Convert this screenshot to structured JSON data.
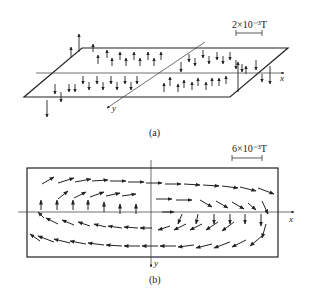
{
  "figure": {
    "panel_a": {
      "caption": "(a)",
      "scale_label": "2×10⁻³T",
      "x_label": "x",
      "y_label": "y",
      "description": "Vertical field component arrows over a tilted plane; upward arrows on upper-left and lower-right quadrants, downward on the others"
    },
    "panel_b": {
      "caption": "(b)",
      "scale_label": "6×10⁻³T",
      "x_label": "x",
      "y_label": "y",
      "description": "In-plane field vectors forming a clockwise circulation loop within a rectangle"
    },
    "colors": {
      "ink": "#222222",
      "background": "#ffffff"
    }
  }
}
